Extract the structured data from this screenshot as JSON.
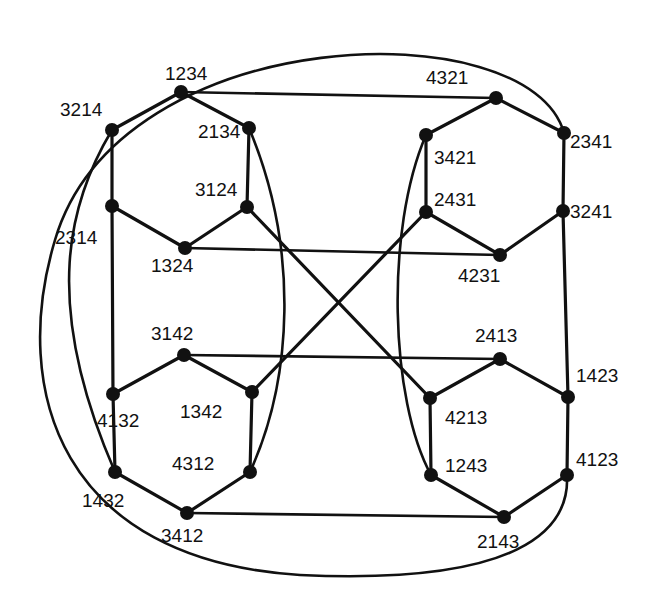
{
  "diagram": {
    "nodes": [
      {
        "id": "1234",
        "label": "1234"
      },
      {
        "id": "2134",
        "label": "2134"
      },
      {
        "id": "3124",
        "label": "3124"
      },
      {
        "id": "1324",
        "label": "1324"
      },
      {
        "id": "2314",
        "label": "2314"
      },
      {
        "id": "3214",
        "label": "3214"
      },
      {
        "id": "4321",
        "label": "4321"
      },
      {
        "id": "2341",
        "label": "2341"
      },
      {
        "id": "3241",
        "label": "3241"
      },
      {
        "id": "4231",
        "label": "4231"
      },
      {
        "id": "2431",
        "label": "2431"
      },
      {
        "id": "3421",
        "label": "3421"
      },
      {
        "id": "3142",
        "label": "3142"
      },
      {
        "id": "1342",
        "label": "1342"
      },
      {
        "id": "4312",
        "label": "4312"
      },
      {
        "id": "3412",
        "label": "3412"
      },
      {
        "id": "1432",
        "label": "1432"
      },
      {
        "id": "4132",
        "label": "4132"
      },
      {
        "id": "2413",
        "label": "2413"
      },
      {
        "id": "1423",
        "label": "1423"
      },
      {
        "id": "4123",
        "label": "4123"
      },
      {
        "id": "2143",
        "label": "2143"
      },
      {
        "id": "1243",
        "label": "1243"
      },
      {
        "id": "4213",
        "label": "4213"
      }
    ],
    "edges": [
      [
        "1234",
        "2134"
      ],
      [
        "2134",
        "3124"
      ],
      [
        "3124",
        "1324"
      ],
      [
        "1324",
        "2314"
      ],
      [
        "2314",
        "3214"
      ],
      [
        "3214",
        "1234"
      ],
      [
        "4321",
        "2341"
      ],
      [
        "2341",
        "3241"
      ],
      [
        "3241",
        "4231"
      ],
      [
        "4231",
        "2431"
      ],
      [
        "2431",
        "3421"
      ],
      [
        "3421",
        "4321"
      ],
      [
        "3142",
        "1342"
      ],
      [
        "1342",
        "4312"
      ],
      [
        "4312",
        "3412"
      ],
      [
        "3412",
        "1432"
      ],
      [
        "1432",
        "4132"
      ],
      [
        "4132",
        "3142"
      ],
      [
        "2413",
        "1423"
      ],
      [
        "1423",
        "4123"
      ],
      [
        "4123",
        "2143"
      ],
      [
        "2143",
        "1243"
      ],
      [
        "1243",
        "4213"
      ],
      [
        "4213",
        "2413"
      ],
      [
        "1234",
        "4321"
      ],
      [
        "1324",
        "4231"
      ],
      [
        "3142",
        "2413"
      ],
      [
        "3412",
        "2143"
      ],
      [
        "3124",
        "4213"
      ],
      [
        "2431",
        "1342"
      ],
      [
        "2314",
        "4132"
      ],
      [
        "3241",
        "1423"
      ],
      [
        "2134",
        "4312"
      ],
      [
        "3421",
        "1243"
      ],
      [
        "3214",
        "1432"
      ],
      [
        "2341",
        "4123"
      ]
    ]
  }
}
